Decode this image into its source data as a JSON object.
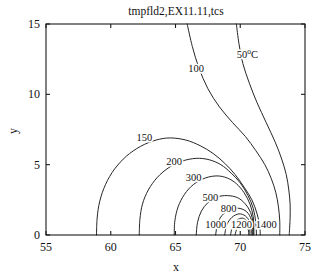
{
  "chart_data": {
    "type": "line",
    "subtype": "contour",
    "title": "tmpfld2,EX11.11,tcs",
    "xlabel": "x",
    "ylabel": "y",
    "xlim": [
      55,
      75
    ],
    "ylim": [
      0,
      15
    ],
    "xticks": [
      55,
      60,
      65,
      70,
      75
    ],
    "yticks": [
      0,
      5,
      10,
      15
    ],
    "xticklabels": [
      "55",
      "60",
      "65",
      "70",
      "75"
    ],
    "yticklabels": [
      "0",
      "5",
      "10",
      "15"
    ],
    "grid": false,
    "legend": null,
    "contour_levels": [
      50,
      100,
      150,
      200,
      300,
      500,
      800,
      1000,
      1200,
      1400
    ],
    "level_unit": "°C",
    "contour_labels": [
      {
        "text": "50",
        "sup": "o",
        "suffix": "C",
        "x": 70.55,
        "y": 12.6
      },
      {
        "text": "100",
        "x": 66.6,
        "y": 11.6
      },
      {
        "text": "150",
        "x": 62.6,
        "y": 6.65
      },
      {
        "text": "200",
        "x": 64.9,
        "y": 4.95
      },
      {
        "text": "300",
        "x": 66.4,
        "y": 3.85
      },
      {
        "text": "500",
        "x": 67.7,
        "y": 2.45
      },
      {
        "text": "800",
        "x": 69.1,
        "y": 1.65
      },
      {
        "text": "1000",
        "x": 68.1,
        "y": 0.5
      },
      {
        "text": "1200",
        "x": 70.1,
        "y": 0.5
      },
      {
        "text": "1400",
        "x": 72.0,
        "y": 0.5
      }
    ],
    "contours": [
      {
        "level": 50,
        "points": [
          [
            69.7,
            15.0
          ],
          [
            69.9,
            13.6
          ],
          [
            70.2,
            12.2
          ],
          [
            70.7,
            10.8
          ],
          [
            71.3,
            9.4
          ],
          [
            72.0,
            8.0
          ],
          [
            72.7,
            6.6
          ],
          [
            73.2,
            5.4
          ],
          [
            73.55,
            4.3
          ],
          [
            73.75,
            3.2
          ],
          [
            73.85,
            2.2
          ],
          [
            73.85,
            1.2
          ],
          [
            73.8,
            0.3
          ],
          [
            73.78,
            0.0
          ]
        ]
      },
      {
        "level": 100,
        "points": [
          [
            65.9,
            15.0
          ],
          [
            66.3,
            13.4
          ],
          [
            66.8,
            11.9
          ],
          [
            67.5,
            10.4
          ],
          [
            68.4,
            9.1
          ],
          [
            69.4,
            8.0
          ],
          [
            70.4,
            7.0
          ],
          [
            71.2,
            6.0
          ],
          [
            71.9,
            5.0
          ],
          [
            72.4,
            4.0
          ],
          [
            72.75,
            3.0
          ],
          [
            72.95,
            2.0
          ],
          [
            73.05,
            1.0
          ],
          [
            73.05,
            0.0
          ]
        ]
      },
      {
        "level": 150,
        "points": [
          [
            58.9,
            0.0
          ],
          [
            58.95,
            1.2
          ],
          [
            59.15,
            2.4
          ],
          [
            59.6,
            3.6
          ],
          [
            60.3,
            4.7
          ],
          [
            61.2,
            5.6
          ],
          [
            62.3,
            6.3
          ],
          [
            63.5,
            6.75
          ],
          [
            64.6,
            6.9
          ],
          [
            65.8,
            6.75
          ],
          [
            66.9,
            6.35
          ],
          [
            67.9,
            5.8
          ],
          [
            68.8,
            5.1
          ],
          [
            69.6,
            4.3
          ],
          [
            70.3,
            3.4
          ],
          [
            70.9,
            2.5
          ],
          [
            71.3,
            1.5
          ],
          [
            71.5,
            0.6
          ],
          [
            71.55,
            0.0
          ]
        ]
      },
      {
        "level": 200,
        "points": [
          [
            62.2,
            0.0
          ],
          [
            62.25,
            1.1
          ],
          [
            62.45,
            2.2
          ],
          [
            62.9,
            3.2
          ],
          [
            63.6,
            4.1
          ],
          [
            64.5,
            4.8
          ],
          [
            65.5,
            5.25
          ],
          [
            66.6,
            5.45
          ],
          [
            67.6,
            5.35
          ],
          [
            68.5,
            5.0
          ],
          [
            69.3,
            4.4
          ],
          [
            70.0,
            3.7
          ],
          [
            70.6,
            2.8
          ],
          [
            71.0,
            1.9
          ],
          [
            71.2,
            0.9
          ],
          [
            71.25,
            0.0
          ]
        ]
      },
      {
        "level": 300,
        "points": [
          [
            64.9,
            0.0
          ],
          [
            64.95,
            1.0
          ],
          [
            65.2,
            2.0
          ],
          [
            65.7,
            2.9
          ],
          [
            66.4,
            3.6
          ],
          [
            67.3,
            4.05
          ],
          [
            68.2,
            4.2
          ],
          [
            69.0,
            4.05
          ],
          [
            69.7,
            3.65
          ],
          [
            70.3,
            3.0
          ],
          [
            70.75,
            2.2
          ],
          [
            71.0,
            1.3
          ],
          [
            71.05,
            0.4
          ],
          [
            71.05,
            0.0
          ]
        ]
      },
      {
        "level": 500,
        "points": [
          [
            66.6,
            0.0
          ],
          [
            66.7,
            0.9
          ],
          [
            67.0,
            1.7
          ],
          [
            67.5,
            2.3
          ],
          [
            68.2,
            2.7
          ],
          [
            69.0,
            2.8
          ],
          [
            69.8,
            2.65
          ],
          [
            70.4,
            2.2
          ],
          [
            70.8,
            1.6
          ],
          [
            71.0,
            0.8
          ],
          [
            71.0,
            0.0
          ]
        ]
      },
      {
        "level": 800,
        "points": [
          [
            68.1,
            0.0
          ],
          [
            68.25,
            0.8
          ],
          [
            68.6,
            1.4
          ],
          [
            69.2,
            1.8
          ],
          [
            69.9,
            1.9
          ],
          [
            70.5,
            1.65
          ],
          [
            70.85,
            1.1
          ],
          [
            70.95,
            0.4
          ],
          [
            70.95,
            0.0
          ]
        ]
      },
      {
        "level": 1000,
        "points": [
          [
            68.8,
            0.0
          ],
          [
            68.95,
            0.7
          ],
          [
            69.35,
            1.25
          ],
          [
            69.9,
            1.5
          ],
          [
            70.4,
            1.35
          ],
          [
            70.75,
            0.9
          ],
          [
            70.85,
            0.3
          ],
          [
            70.85,
            0.0
          ]
        ]
      },
      {
        "level": 1200,
        "points": [
          [
            69.25,
            0.0
          ],
          [
            69.4,
            0.6
          ],
          [
            69.75,
            1.05
          ],
          [
            70.15,
            1.2
          ],
          [
            70.5,
            1.0
          ],
          [
            70.7,
            0.6
          ],
          [
            70.75,
            0.0
          ]
        ]
      },
      {
        "level": 1400,
        "points": [
          [
            69.6,
            0.0
          ],
          [
            69.75,
            0.5
          ],
          [
            70.0,
            0.85
          ],
          [
            70.3,
            0.9
          ],
          [
            70.55,
            0.6
          ],
          [
            70.65,
            0.2
          ],
          [
            70.65,
            0.0
          ]
        ]
      }
    ]
  }
}
